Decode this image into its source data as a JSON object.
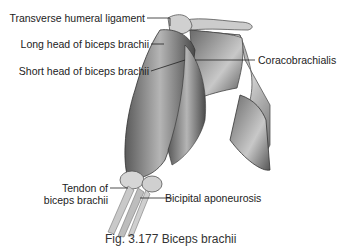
{
  "figure": {
    "title": "Biceps brachii",
    "caption": "Fig. 3.177 Biceps brachii",
    "labels": {
      "transverse_humeral_ligament": "Transverse humeral ligament",
      "long_head": "Long head of biceps brachii",
      "short_head": "Short head of biceps brachii",
      "coracobrachialis": "Coracobrachialis",
      "tendon_line1": "Tendon of",
      "tendon_line2": "biceps brachii",
      "bicipital_aponeurosis": "Bicipital aponeurosis"
    }
  }
}
